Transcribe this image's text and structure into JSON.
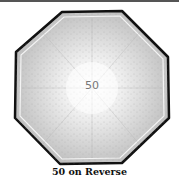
{
  "figure": {
    "image": {
      "subject": "octagonal coin reverse",
      "denomination_text": "50",
      "colors": {
        "outline": "#111111",
        "field_light": "#f4f4f4",
        "field_dark": "#bdbdbd"
      }
    },
    "caption": "50 on Reverse"
  }
}
